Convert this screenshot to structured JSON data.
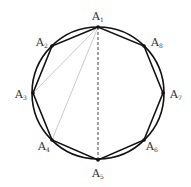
{
  "diagram": {
    "circle": {
      "cx": 98,
      "cy": 93,
      "r": 66
    },
    "vertices": [
      {
        "name": "A",
        "sub": "1",
        "x": 98,
        "y": 27,
        "lx": 92,
        "ly": 20
      },
      {
        "name": "A",
        "sub": "2",
        "x": 52,
        "y": 46,
        "lx": 36,
        "ly": 46
      },
      {
        "name": "A",
        "sub": "3",
        "x": 33,
        "y": 93,
        "lx": 15,
        "ly": 98
      },
      {
        "name": "A",
        "sub": "4",
        "x": 52,
        "y": 140,
        "lx": 38,
        "ly": 150
      },
      {
        "name": "A",
        "sub": "5",
        "x": 98,
        "y": 160,
        "lx": 92,
        "ly": 177
      },
      {
        "name": "A",
        "sub": "6",
        "x": 144,
        "y": 140,
        "lx": 146,
        "ly": 150
      },
      {
        "name": "A",
        "sub": "7",
        "x": 163,
        "y": 93,
        "lx": 170,
        "ly": 98
      },
      {
        "name": "A",
        "sub": "8",
        "x": 144,
        "y": 46,
        "lx": 151,
        "ly": 46
      }
    ],
    "diagonals": [
      {
        "from": "A1",
        "to": "A3",
        "style": "thin-gray"
      },
      {
        "from": "A1",
        "to": "A4",
        "style": "thin-gray"
      },
      {
        "from": "A1",
        "to": "A5",
        "style": "dashed"
      }
    ],
    "colors": {
      "stroke": "#111111",
      "diagonal": "#bbbbbb",
      "label": "#333333"
    }
  }
}
